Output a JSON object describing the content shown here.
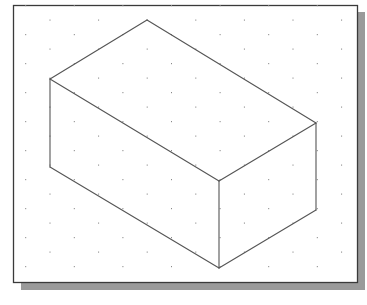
{
  "figure": {
    "kind": "isometric-drawing",
    "colors": {
      "background": "#ffffff",
      "frame_border": "#3a3a3a",
      "frame_shadow": "#9a9a9a",
      "line": "#555555",
      "grid_dot": "#8a8a8a"
    },
    "frame": {
      "x": 13,
      "y": 5,
      "width": 344,
      "height": 277
    },
    "shadow": {
      "dx": 6,
      "dy": 7
    },
    "grid": {
      "x0": 25.7,
      "y0": 5.5,
      "col_step": 24.3,
      "row_step": 14.5,
      "rows": 19,
      "cols": 14
    },
    "box": {
      "vertices": {
        "top_back": [
          147,
          20
        ],
        "top_left": [
          50,
          79
        ],
        "top_right": [
          316,
          123
        ],
        "top_front": [
          219,
          181
        ],
        "bottom_left": [
          50,
          167
        ],
        "bottom_right": [
          316,
          210
        ],
        "bottom_front": [
          219,
          268
        ]
      },
      "edges": [
        [
          "top_back",
          "top_left"
        ],
        [
          "top_back",
          "top_right"
        ],
        [
          "top_left",
          "top_front"
        ],
        [
          "top_right",
          "top_front"
        ],
        [
          "top_left",
          "bottom_left"
        ],
        [
          "top_front",
          "bottom_front"
        ],
        [
          "top_right",
          "bottom_right"
        ],
        [
          "bottom_left",
          "bottom_front"
        ],
        [
          "bottom_right",
          "bottom_front"
        ]
      ]
    }
  }
}
